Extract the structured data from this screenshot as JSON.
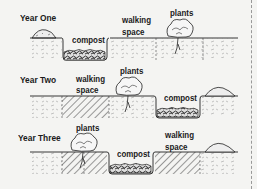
{
  "diagram": {
    "rows": [
      {
        "year_label": "Year One",
        "labels": {
          "compost": "compost",
          "walking": "walking\nspace",
          "plants": "plants"
        },
        "walking_line1": "walking",
        "walking_line2": "space"
      },
      {
        "year_label": "Year Two",
        "walking_line1": "walking",
        "walking_line2": "space",
        "plants": "plants",
        "compost": "compost"
      },
      {
        "year_label": "Year Three",
        "plants": "plants",
        "compost": "compost",
        "walking_line1": "walking",
        "walking_line2": "space"
      }
    ],
    "row1": {
      "compost": "compost",
      "plants": "plants"
    },
    "colors": {
      "background": "#f4f4f2",
      "ink": "#1a1a1a",
      "light_soil": "#b8b8b8",
      "dark_soil": "#555555"
    }
  }
}
